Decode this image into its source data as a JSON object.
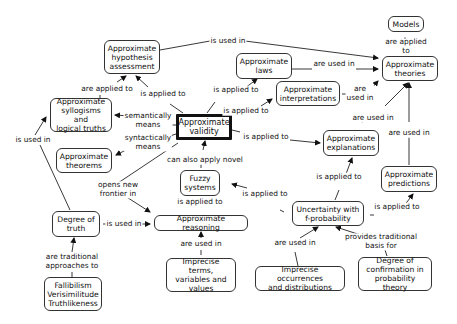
{
  "nodes": {
    "models": "Models",
    "hypothesis": "Approximate\nhypothesis\nassessment",
    "laws": "Approximate\nlaws",
    "theories": "Approximate\ntheories",
    "interpretations": "Approximate\ninterpretations",
    "syllogisms": "Approximate\nsyllogisms and\nlogical truths",
    "validity": "Approximate\nvalidity",
    "theorems": "Approximate\ntheorems",
    "explanations": "Approximate\nexplanations",
    "predictions": "Approximate\npredictions",
    "fuzzy": "Fuzzy\nsystems",
    "uncertainty": "Uncertainty with\nf-probability",
    "degree_truth": "Degree of\ntruth",
    "reasoning": "Approximate reasoning",
    "imprecise_terms": "Imprecise terms,\nvariables and\nvalues",
    "imprecise_occ": "Imprecise occurrences\nand distributions",
    "confirmation": "Degree of\nconfirmation in\nprobability theory",
    "fallibilism": "Fallibilism\nVerisimilitude\nTruthlikeness"
  },
  "links": {
    "hyp_theories": "is used in",
    "theories_models": "are applied to",
    "laws_theories": "are used in",
    "interp_theories": "are\nused in",
    "expl_theories": "are used in",
    "pred_theories": "are used in",
    "syl_hyp": "are applied to",
    "val_hyp": "is applied to",
    "val_laws": "is applied to",
    "val_interp": "is applied to",
    "val_syl": "semantically\nmeans",
    "val_thm": "syntactically\nmeans",
    "val_expl": "is applied to",
    "fuzzy_val": "can also apply novel",
    "val_reason": "opens new\nfrontier in",
    "fuzzy_reason": "is applied to",
    "unc_fuzzy": "is applied to",
    "unc_expl": "is applied to",
    "unc_pred": "is applied to",
    "deg_syl": "is used in",
    "deg_reason": "is used in",
    "fal_deg": "are traditional\napproaches to",
    "terms_reason": "are used in",
    "occ_unc": "are used in",
    "conf_unc": "provides traditional basis for"
  }
}
